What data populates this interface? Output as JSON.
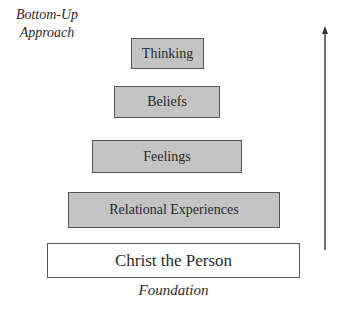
{
  "diagram": {
    "title_label": "Bottom-Up Approach",
    "title_lines": [
      "Bottom-Up",
      "Approach"
    ],
    "levels": [
      {
        "label": "Thinking",
        "fill": "#c3c3c3"
      },
      {
        "label": "Beliefs",
        "fill": "#c3c3c3"
      },
      {
        "label": "Feelings",
        "fill": "#c3c3c3"
      },
      {
        "label": "Relational Experiences",
        "fill": "#c3c3c3"
      },
      {
        "label": "Christ the Person",
        "fill": "#ffffff"
      }
    ],
    "base_label": "Foundation",
    "arrow_direction": "up"
  }
}
